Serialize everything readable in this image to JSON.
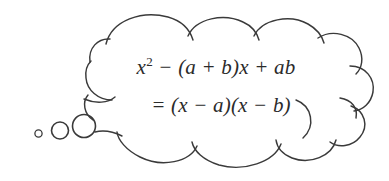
{
  "figure": {
    "kind": "thought-bubble-diagram",
    "background_color": "#ffffff",
    "stroke_color": "#3a3a3a",
    "text_color": "#2b2b2b",
    "alt_label": "Hand-drawn thought bubble containing a factoring identity"
  },
  "thought_bubble": {
    "name": "thought-cloud",
    "trail_bubbles": [
      {
        "label": "small-trail-bubble",
        "cx": 38.5,
        "cy": 133.5,
        "r": 3.6
      },
      {
        "label": "medium-trail-bubble",
        "cx": 60.0,
        "cy": 130.5,
        "r": 8.5
      },
      {
        "label": "large-trail-bubble",
        "cx": 84.0,
        "cy": 126.0,
        "r": 11.5
      }
    ]
  },
  "formula": {
    "line_1": "x² − (a + b)x + ab",
    "line_2": "= (x − a)(x − b)",
    "line_1_parts": {
      "base": "x",
      "exponent": "2",
      "rest": " − (a + b)x + ab"
    }
  },
  "chart_data": {
    "type": "table",
    "categories": [
      "expanded form",
      "factored form"
    ],
    "values": [
      "x^2 - (a + b)x + ab",
      "(x - a)(x - b)"
    ]
  }
}
